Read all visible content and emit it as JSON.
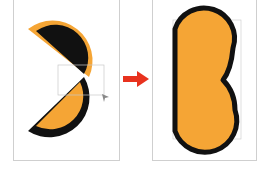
{
  "diagram": {
    "colors": {
      "fill": "#F5A535",
      "stroke": "#111111",
      "arrow": "#E8321E",
      "panel_border": "#CFCFCF",
      "selection_box": "#C8C8C8",
      "background": "#FFFFFF"
    },
    "panels": [
      {
        "id": "before",
        "content": "two semicircles, one black with orange outline, one orange with black outline, with selection bounding box and cursor"
      },
      {
        "id": "after",
        "content": "merged B shape, orange fill with black outline, with selection bounding box"
      }
    ],
    "arrow": {
      "direction": "right",
      "icon": "arrow-right-icon"
    }
  }
}
